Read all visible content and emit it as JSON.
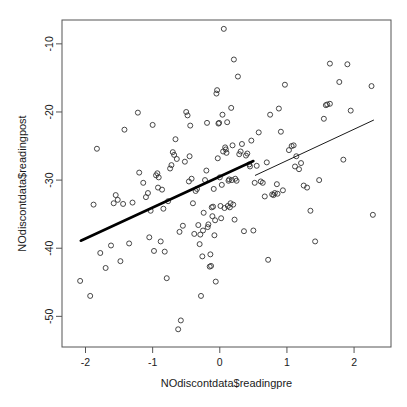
{
  "chart_data": {
    "type": "scatter",
    "title": "",
    "xlabel": "NOdiscontdata$readingpre",
    "ylabel": "NOdiscontdata$readingpost",
    "xlim": [
      -2.35,
      2.55
    ],
    "ylim": [
      -54.5,
      -6.5
    ],
    "xticks": [
      -2,
      -1,
      0,
      1,
      2
    ],
    "xtick_labels": [
      "-2",
      "-1",
      "0",
      "1",
      "2"
    ],
    "yticks": [
      -10,
      -20,
      -30,
      -40,
      -50
    ],
    "ytick_labels": [
      "-10",
      "-20",
      "-30",
      "-40",
      "-50"
    ],
    "grid": false,
    "legend": null,
    "point_marker": "open-circle",
    "point_color": "#333333",
    "line_color": "#000000",
    "frame_color": "#555555",
    "n_points": 155,
    "points": [
      [
        -2.08,
        -44.8
      ],
      [
        -1.93,
        -47.0
      ],
      [
        -1.88,
        -33.6
      ],
      [
        -1.83,
        -25.4
      ],
      [
        -1.78,
        -40.7
      ],
      [
        -1.7,
        -42.9
      ],
      [
        -1.62,
        -39.6
      ],
      [
        -1.58,
        -33.4
      ],
      [
        -1.55,
        -32.2
      ],
      [
        -1.52,
        -32.9
      ],
      [
        -1.48,
        -41.9
      ],
      [
        -1.44,
        -33.5
      ],
      [
        -1.42,
        -22.6
      ],
      [
        -1.35,
        -39.3
      ],
      [
        -1.22,
        -20.1
      ],
      [
        -1.2,
        -28.9
      ],
      [
        -1.14,
        -30.4
      ],
      [
        -1.1,
        -32.5
      ],
      [
        -1.07,
        -31.9
      ],
      [
        -1.05,
        -38.4
      ],
      [
        -1.03,
        -34.5
      ],
      [
        -1.0,
        -21.9
      ],
      [
        -0.98,
        -40.4
      ],
      [
        -0.95,
        -29.3
      ],
      [
        -0.93,
        -29.0
      ],
      [
        -0.91,
        -29.6
      ],
      [
        -0.88,
        -39.0
      ],
      [
        -0.86,
        -31.4
      ],
      [
        -0.84,
        -34.2
      ],
      [
        -0.82,
        -40.5
      ],
      [
        -0.79,
        -44.4
      ],
      [
        -0.77,
        -33.1
      ],
      [
        -0.74,
        -28.3
      ],
      [
        -0.72,
        -27.8
      ],
      [
        -0.7,
        -25.9
      ],
      [
        -0.68,
        -26.3
      ],
      [
        -0.66,
        -24.0
      ],
      [
        -0.64,
        -26.9
      ],
      [
        -0.62,
        -51.9
      ],
      [
        -0.6,
        -37.6
      ],
      [
        -0.58,
        -50.6
      ],
      [
        -0.55,
        -36.7
      ],
      [
        -0.52,
        -27.3
      ],
      [
        -0.5,
        -20.0
      ],
      [
        -0.48,
        -20.5
      ],
      [
        -0.46,
        -30.2
      ],
      [
        -0.44,
        -22.0
      ],
      [
        -0.42,
        -29.8
      ],
      [
        -0.4,
        -33.4
      ],
      [
        -0.38,
        -37.9
      ],
      [
        -0.36,
        -31.6
      ],
      [
        -0.34,
        -31.3
      ],
      [
        -0.32,
        -36.6
      ],
      [
        -0.3,
        -39.4
      ],
      [
        -0.28,
        -47.0
      ],
      [
        -0.26,
        -41.2
      ],
      [
        -0.24,
        -34.8
      ],
      [
        -0.22,
        -30.0
      ],
      [
        -0.2,
        -28.6
      ],
      [
        -0.19,
        -21.6
      ],
      [
        -0.18,
        -36.9
      ],
      [
        -0.17,
        -36.5
      ],
      [
        -0.15,
        -42.7
      ],
      [
        -0.13,
        -42.6
      ],
      [
        -0.12,
        -34.0
      ],
      [
        -0.11,
        -35.3
      ],
      [
        -0.1,
        -33.9
      ],
      [
        -0.09,
        -31.3
      ],
      [
        -0.08,
        -38.1
      ],
      [
        -0.06,
        -44.9
      ],
      [
        -0.05,
        -17.3
      ],
      [
        -0.04,
        -16.8
      ],
      [
        -0.03,
        -26.8
      ],
      [
        -0.02,
        -21.7
      ],
      [
        -0.01,
        -21.6
      ],
      [
        0.0,
        -29.6
      ],
      [
        0.01,
        -33.8
      ],
      [
        0.02,
        -35.6
      ],
      [
        0.03,
        -30.7
      ],
      [
        0.04,
        -20.4
      ],
      [
        0.05,
        -25.8
      ],
      [
        0.06,
        -7.8
      ],
      [
        0.08,
        -25.2
      ],
      [
        0.09,
        -25.5
      ],
      [
        0.1,
        -26.0
      ],
      [
        0.11,
        -21.5
      ],
      [
        0.12,
        -33.8
      ],
      [
        0.13,
        -30.1
      ],
      [
        0.14,
        -29.9
      ],
      [
        0.15,
        -34.0
      ],
      [
        0.16,
        -33.4
      ],
      [
        0.17,
        -19.4
      ],
      [
        0.19,
        -24.9
      ],
      [
        0.21,
        -12.3
      ],
      [
        0.23,
        -29.8
      ],
      [
        0.25,
        -30.1
      ],
      [
        0.27,
        -14.8
      ],
      [
        0.29,
        -26.2
      ],
      [
        0.31,
        -25.8
      ],
      [
        0.33,
        -24.7
      ],
      [
        0.36,
        -37.5
      ],
      [
        0.39,
        -26.4
      ],
      [
        0.41,
        -26.1
      ],
      [
        0.44,
        -27.7
      ],
      [
        0.47,
        -24.2
      ],
      [
        0.5,
        -37.4
      ],
      [
        0.52,
        -30.4
      ],
      [
        0.55,
        -27.9
      ],
      [
        0.58,
        -23.0
      ],
      [
        0.61,
        -30.2
      ],
      [
        0.64,
        -30.4
      ],
      [
        0.67,
        -32.4
      ],
      [
        0.7,
        -27.4
      ],
      [
        0.72,
        -41.7
      ],
      [
        0.75,
        -20.4
      ],
      [
        0.78,
        -32.1
      ],
      [
        0.8,
        -32.2
      ],
      [
        0.82,
        -31.9
      ],
      [
        0.85,
        -30.6
      ],
      [
        0.88,
        -19.5
      ],
      [
        0.91,
        -22.9
      ],
      [
        0.94,
        -31.5
      ],
      [
        0.97,
        -16.0
      ],
      [
        1.03,
        -25.6
      ],
      [
        1.07,
        -25.0
      ],
      [
        1.1,
        -24.9
      ],
      [
        1.14,
        -26.5
      ],
      [
        1.18,
        -28.4
      ],
      [
        1.21,
        -27.5
      ],
      [
        1.25,
        -30.8
      ],
      [
        1.3,
        -31.1
      ],
      [
        1.35,
        -34.5
      ],
      [
        1.42,
        -39.0
      ],
      [
        1.48,
        -30.0
      ],
      [
        1.55,
        -21.0
      ],
      [
        1.58,
        -19.0
      ],
      [
        1.6,
        -18.9
      ],
      [
        1.64,
        -12.9
      ],
      [
        1.78,
        -15.6
      ],
      [
        1.84,
        -27.0
      ],
      [
        1.9,
        -13.0
      ],
      [
        1.95,
        -19.8
      ],
      [
        2.26,
        -16.2
      ],
      [
        2.28,
        -35.1
      ],
      [
        -0.25,
        -37.4
      ],
      [
        -0.29,
        -38.0
      ],
      [
        0.18,
        -30.0
      ],
      [
        0.2,
        -33.6
      ],
      [
        0.22,
        -35.8
      ],
      [
        -0.07,
        -35.9
      ],
      [
        -0.14,
        -40.9
      ],
      [
        0.07,
        -34.1
      ],
      [
        -0.45,
        -26.5
      ],
      [
        -0.92,
        -31.1
      ],
      [
        -1.3,
        -33.3
      ],
      [
        0.45,
        -28.0
      ],
      [
        0.86,
        -32.0
      ],
      [
        1.12,
        -28.0
      ],
      [
        1.64,
        -18.8
      ]
    ],
    "fit_lines": [
      {
        "name": "left-segment-fit",
        "style": "thick",
        "x_start": -2.07,
        "y_start": -38.9,
        "x_end": 0.5,
        "y_end": -27.2
      },
      {
        "name": "right-segment-fit",
        "style": "thin",
        "x_start": 0.53,
        "y_start": -29.3,
        "x_end": 2.29,
        "y_end": -21.2
      }
    ]
  },
  "plot": {
    "frame": {
      "left": 62,
      "top": 20,
      "right": 391,
      "bottom": 347
    },
    "x_axis_label": "NOdiscontdata$readingpre",
    "y_axis_label": "NOdiscontdata$readingpost"
  }
}
